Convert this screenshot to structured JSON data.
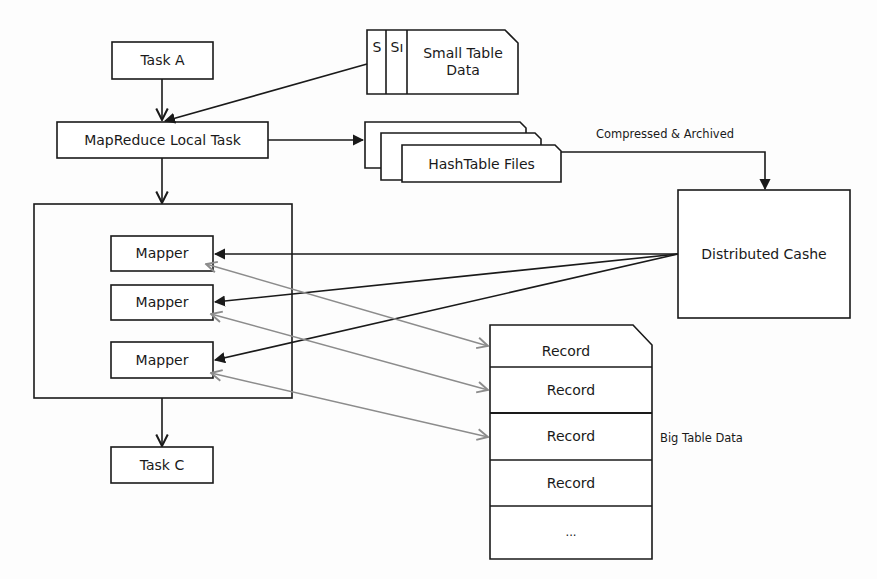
{
  "diagram": {
    "type": "flow",
    "colors": {
      "stroke": "#1a1a1a",
      "gray_link": "#8c8c8c",
      "background": "#fdfdfd"
    },
    "nodes": {
      "task_a": "Task A",
      "small_table": {
        "stack_labels": [
          "S",
          "Sı"
        ],
        "label_line1": "Small Table",
        "label_line2": "Data"
      },
      "local_task": "MapReduce Local Task",
      "hashtable_files": "HashTable Files",
      "compress_label": "Compressed & Archived",
      "distributed_cache": "Distributed Cashe",
      "mappers": [
        "Mapper",
        "Mapper",
        "Mapper"
      ],
      "task_c": "Task C",
      "big_table": {
        "rows": [
          "Record",
          "Record",
          "Record",
          "Record",
          "..."
        ],
        "caption": "Big Table Data"
      }
    },
    "edges": [
      {
        "from": "Task A",
        "to": "MapReduce Local Task",
        "style": "solid-arrow"
      },
      {
        "from": "Small Table Data",
        "to": "MapReduce Local Task",
        "style": "solid-arrow"
      },
      {
        "from": "MapReduce Local Task",
        "to": "HashTable Files",
        "style": "solid-arrow"
      },
      {
        "from": "HashTable Files",
        "to": "Distributed Cashe",
        "style": "solid-arrow",
        "label": "Compressed & Archived"
      },
      {
        "from": "MapReduce Local Task",
        "to": "Mapper group",
        "style": "open-arrow"
      },
      {
        "from": "Distributed Cashe",
        "to": "Mapper 1",
        "style": "solid-arrow"
      },
      {
        "from": "Distributed Cashe",
        "to": "Mapper 2",
        "style": "solid-arrow"
      },
      {
        "from": "Distributed Cashe",
        "to": "Mapper 3",
        "style": "solid-arrow"
      },
      {
        "from": "Mapper 1",
        "to": "Record 1",
        "style": "gray-bidirectional"
      },
      {
        "from": "Mapper 2",
        "to": "Record 2",
        "style": "gray-bidirectional"
      },
      {
        "from": "Mapper 3",
        "to": "Record 3",
        "style": "gray-bidirectional"
      },
      {
        "from": "Mapper group",
        "to": "Task C",
        "style": "open-arrow"
      }
    ]
  }
}
